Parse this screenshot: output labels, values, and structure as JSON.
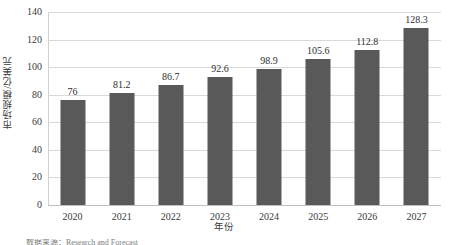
{
  "chart_data": {
    "type": "bar",
    "title": "",
    "categories": [
      "2020",
      "2021",
      "2022",
      "2023",
      "2024",
      "2025",
      "2026",
      "2027"
    ],
    "values": [
      76,
      81.2,
      86.7,
      92.6,
      98.9,
      105.6,
      112.8,
      128.3
    ],
    "data_labels": [
      "76",
      "81.2",
      "86.7",
      "92.6",
      "98.9",
      "105.6",
      "112.8",
      "128.3"
    ],
    "xlabel": "年份",
    "ylabel": "市场规模/亿美元",
    "ylim": [
      0,
      140
    ],
    "yticks": [
      0,
      20,
      40,
      60,
      80,
      100,
      120,
      140
    ],
    "ytick_labels": [
      "0",
      "20",
      "40",
      "60",
      "80",
      "100",
      "120",
      "140"
    ],
    "grid": "horizontal",
    "legend": "none",
    "bar_color": "#595959",
    "grid_color": "#d9d9d9",
    "background": "#ffffff"
  },
  "caption": {
    "text": "数据来源：Research and Forecast"
  }
}
